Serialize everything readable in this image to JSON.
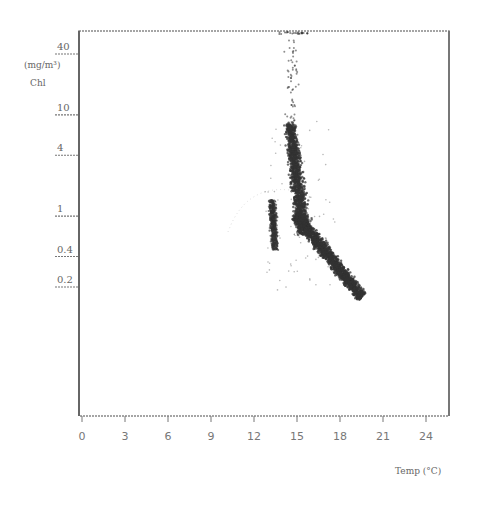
{
  "chart_data": {
    "type": "scatter",
    "title": "",
    "xlabel": "Temp (°C)",
    "ylabel": "Chl (mg/m³)",
    "ylabel_line1": "(mg/m³)",
    "ylabel_line2": "Chl",
    "x_scale": "linear",
    "y_scale": "log",
    "xlim": [
      0,
      26
    ],
    "ylim": [
      0.02,
      60
    ],
    "x_ticks": [
      0,
      3,
      6,
      9,
      12,
      15,
      18,
      21,
      24
    ],
    "x_tick_labels": [
      "0",
      "3",
      "6",
      "9",
      "12",
      "15",
      "18",
      "21",
      "24"
    ],
    "y_ticks": [
      40,
      10,
      4,
      1,
      0.4,
      0.2
    ],
    "y_tick_labels": [
      "40",
      "10",
      "4",
      "1",
      "0.4",
      "0.2"
    ],
    "grid": false,
    "legend": null,
    "point_color": "#333333",
    "clusters": [
      {
        "name": "sparse-top",
        "x_range": [
          14.0,
          15.5
        ],
        "y_range": [
          8,
          40
        ],
        "density": "sparse"
      },
      {
        "name": "main-core",
        "x_range": [
          13.8,
          15.8
        ],
        "y_range": [
          1.5,
          8
        ],
        "density": "dense"
      },
      {
        "name": "main-band",
        "points": [
          [
            14.5,
            4
          ],
          [
            15.0,
            2
          ],
          [
            15.6,
            1.0
          ],
          [
            16.2,
            0.6
          ],
          [
            17.0,
            0.4
          ],
          [
            18.0,
            0.25
          ],
          [
            19.0,
            0.18
          ],
          [
            19.6,
            0.14
          ]
        ],
        "density": "dense"
      },
      {
        "name": "secondary",
        "x_range": [
          12.6,
          13.6
        ],
        "y_range": [
          0.45,
          1.6
        ],
        "density": "medium"
      }
    ]
  },
  "labels": {
    "y_axis_line1": "(mg/m³)",
    "y_axis_line2": "Chl",
    "x_axis": "Temp (°C)"
  }
}
